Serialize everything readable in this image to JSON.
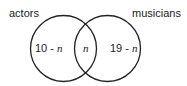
{
  "diagram": {
    "type": "venn",
    "sets": [
      {
        "label": "actors"
      },
      {
        "label": "musicians"
      }
    ],
    "regions": {
      "left_only": {
        "number": "10 - ",
        "var": "n"
      },
      "intersection": {
        "var": "n"
      },
      "right_only": {
        "number": "19 - ",
        "var": "n"
      }
    }
  }
}
